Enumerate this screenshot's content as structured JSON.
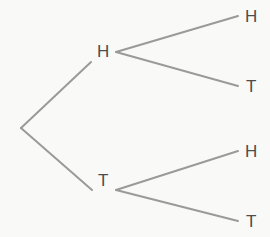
{
  "figure": {
    "background_color": "#f9f9f8",
    "edge_color": "#9a9a9a",
    "label_color": "#4d4d4d",
    "edge_width": 2
  },
  "tree": {
    "root": {
      "label": "",
      "x": 21,
      "y": 128
    },
    "level1": [
      {
        "id": "h",
        "label": "H",
        "label_x": 97,
        "label_y": 43,
        "branch_x": 116,
        "branch_y": 52
      },
      {
        "id": "t",
        "label": "T",
        "label_x": 98,
        "label_y": 172,
        "branch_x": 116,
        "branch_y": 190
      }
    ],
    "leaves": [
      {
        "id": "hh",
        "label": "H",
        "label_x": 245,
        "label_y": 8,
        "edge_end_x": 238,
        "edge_end_y": 16,
        "parent": "h"
      },
      {
        "id": "ht",
        "label": "T",
        "label_x": 246,
        "label_y": 78,
        "edge_end_x": 238,
        "edge_end_y": 86,
        "parent": "h"
      },
      {
        "id": "th",
        "label": "H",
        "label_x": 245,
        "label_y": 143,
        "edge_end_x": 238,
        "edge_end_y": 151,
        "parent": "t"
      },
      {
        "id": "tt",
        "label": "T",
        "label_x": 246,
        "label_y": 213,
        "edge_end_x": 238,
        "edge_end_y": 221,
        "parent": "t"
      }
    ],
    "edges": [
      {
        "id": "root-h",
        "x1": 21,
        "y1": 128,
        "x2": 91,
        "y2": 62
      },
      {
        "id": "root-t",
        "x1": 21,
        "y1": 128,
        "x2": 92,
        "y2": 190
      },
      {
        "id": "h-hh",
        "x1": 116,
        "y1": 52,
        "x2": 238,
        "y2": 16
      },
      {
        "id": "h-ht",
        "x1": 116,
        "y1": 52,
        "x2": 238,
        "y2": 86
      },
      {
        "id": "t-th",
        "x1": 116,
        "y1": 190,
        "x2": 238,
        "y2": 151
      },
      {
        "id": "t-tt",
        "x1": 116,
        "y1": 190,
        "x2": 238,
        "y2": 221
      }
    ]
  },
  "chart_data": {
    "type": "diagram",
    "diagram_type": "probability-tree",
    "levels": 2,
    "nodes": [
      {
        "id": "root",
        "label": "",
        "level": 0,
        "parent": null
      },
      {
        "id": "h",
        "label": "H",
        "level": 1,
        "parent": "root"
      },
      {
        "id": "t",
        "label": "T",
        "level": 1,
        "parent": "root"
      },
      {
        "id": "hh",
        "label": "H",
        "level": 2,
        "parent": "h"
      },
      {
        "id": "ht",
        "label": "T",
        "level": 2,
        "parent": "h"
      },
      {
        "id": "th",
        "label": "H",
        "level": 2,
        "parent": "t"
      },
      {
        "id": "tt",
        "label": "T",
        "level": 2,
        "parent": "t"
      }
    ],
    "outcomes": [
      "HH",
      "HT",
      "TH",
      "TT"
    ],
    "legend": [],
    "xlabel": "",
    "ylabel": ""
  }
}
